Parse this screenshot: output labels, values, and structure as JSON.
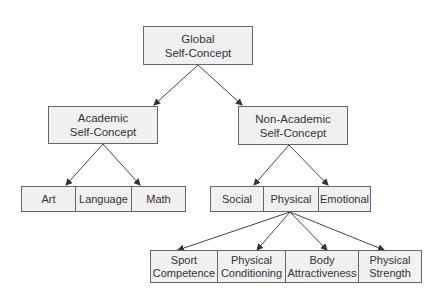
{
  "diagram": {
    "root": {
      "line1": "Global",
      "line2": "Self-Concept"
    },
    "academic": {
      "line1": "Academic",
      "line2": "Self-Concept"
    },
    "non_academic": {
      "line1": "Non-Academic",
      "line2": "Self-Concept"
    },
    "academic_children": [
      "Art",
      "Language",
      "Math"
    ],
    "non_academic_children": [
      "Social",
      "Physical",
      "Emotional"
    ],
    "physical_children": [
      {
        "line1": "Sport",
        "line2": "Competence"
      },
      {
        "line1": "Physical",
        "line2": "Conditioning"
      },
      {
        "line1": "Body",
        "line2": "Attractiveness"
      },
      {
        "line1": "Physical",
        "line2": "Strength"
      }
    ]
  }
}
